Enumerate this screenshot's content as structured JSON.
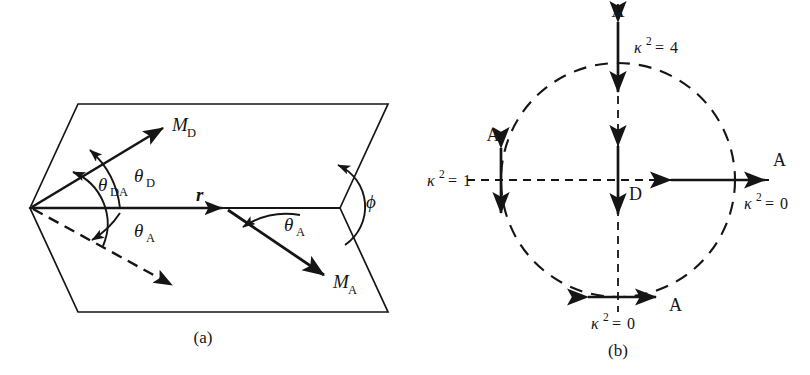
{
  "figure": {
    "background_color": "#ffffff",
    "line_color": "#151515"
  },
  "panel_a": {
    "caption": "(a)",
    "description": "Two planes joined along the donor-acceptor separation vector r, with dihedral angle phi",
    "vectors": [
      {
        "name": "donor-transition-dipole",
        "label_m": "M",
        "label_sub": "D"
      },
      {
        "name": "acceptor-transition-dipole",
        "label_m": "M",
        "label_sub": "A"
      },
      {
        "name": "separation-vector",
        "label_m": "r",
        "label_sub": ""
      }
    ],
    "labels": {
      "m_d_main": "M",
      "m_d_sub": "D",
      "m_a_main": "M",
      "m_a_sub": "A",
      "r": "r",
      "theta": "θ",
      "theta_da_sub": "DA",
      "theta_d_sub": "D",
      "theta_a_sub": "A",
      "theta_a2_sub": "A",
      "phi": "ϕ"
    },
    "angles": [
      {
        "name": "theta-DA",
        "symbol": "θ",
        "subscript": "DA",
        "between": "M_D and M_A"
      },
      {
        "name": "theta-D",
        "symbol": "θ",
        "subscript": "D",
        "between": "M_D and r"
      },
      {
        "name": "theta-A",
        "symbol": "θ",
        "subscript": "A",
        "between": "projected M_A and r"
      },
      {
        "name": "theta-A-right",
        "symbol": "θ",
        "subscript": "A",
        "between": "M_A and r"
      },
      {
        "name": "phi",
        "symbol": "ϕ",
        "subscript": "",
        "between": "the two planes"
      }
    ]
  },
  "panel_b": {
    "caption": "(b)",
    "description": "Circle of acceptor dipole orientations around a fixed vertical donor dipole",
    "donor_label": "D",
    "acceptor_label": "A",
    "kappa_symbol": "κ",
    "kappa_exponent": "2",
    "equals": "=",
    "orientations": [
      {
        "name": "top",
        "position": "top",
        "acceptor": "A",
        "kappa_symbol": "κ",
        "kappa_exponent": "2",
        "equals": "=",
        "kappa_value": "4",
        "arrow": "vertical-double"
      },
      {
        "name": "right",
        "position": "right",
        "acceptor": "A",
        "kappa_symbol": "κ",
        "kappa_exponent": "2",
        "equals": "=",
        "kappa_value": "0",
        "arrow": "horizontal-double"
      },
      {
        "name": "bottom",
        "position": "bottom",
        "acceptor": "A",
        "kappa_symbol": "κ",
        "kappa_exponent": "2",
        "equals": "=",
        "kappa_value": "0",
        "arrow": "horizontal-double"
      },
      {
        "name": "left",
        "position": "left",
        "acceptor": "A",
        "kappa_symbol": "κ",
        "kappa_exponent": "2",
        "equals": "=",
        "kappa_value": "1",
        "arrow": "vertical-double"
      }
    ],
    "center_dipole": {
      "name": "donor",
      "label": "D",
      "arrow": "vertical-double"
    }
  }
}
